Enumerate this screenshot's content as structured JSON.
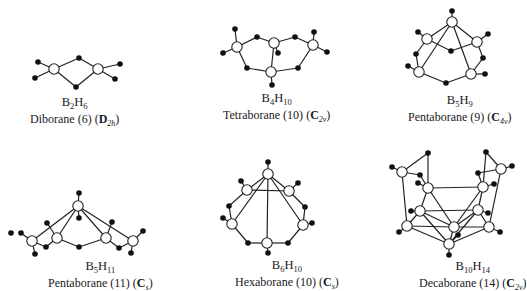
{
  "figure": {
    "structures": [
      {
        "id": "diborane",
        "formula": {
          "el1": "B",
          "n1": "2",
          "el2": "H",
          "n2": "6"
        },
        "name": "Diborane (6)",
        "point_group": {
          "letter": "D",
          "sub": "2h"
        },
        "borons": [
          [
            54,
            69
          ],
          [
            98,
            69
          ]
        ],
        "hydrogens": [
          [
            79,
            58
          ],
          [
            76,
            87
          ],
          [
            38,
            62
          ],
          [
            35,
            78
          ],
          [
            120,
            64
          ],
          [
            115,
            79
          ]
        ],
        "bonds": [
          [
            54,
            69,
            79,
            58
          ],
          [
            79,
            58,
            98,
            69
          ],
          [
            54,
            69,
            76,
            87
          ],
          [
            76,
            87,
            98,
            69
          ],
          [
            54,
            69,
            38,
            62
          ],
          [
            54,
            69,
            35,
            78
          ],
          [
            98,
            69,
            120,
            64
          ],
          [
            98,
            69,
            115,
            79
          ]
        ],
        "label_pos": [
          30,
          96
        ]
      },
      {
        "id": "tetraborane",
        "formula": {
          "el1": "B",
          "n1": "4",
          "el2": "H",
          "n2": "10"
        },
        "name": "Tetraborane (10)",
        "point_group": {
          "letter": "C",
          "sub": "2v"
        },
        "borons": [
          [
            237,
            47
          ],
          [
            274,
            43
          ],
          [
            313,
            45
          ],
          [
            271,
            72
          ]
        ],
        "hydrogens": [
          [
            235,
            29
          ],
          [
            223,
            53
          ],
          [
            257,
            37
          ],
          [
            295,
            37
          ],
          [
            278,
            53
          ],
          [
            314,
            32
          ],
          [
            327,
            52
          ],
          [
            247,
            68
          ],
          [
            298,
            68
          ],
          [
            272,
            85
          ]
        ],
        "bonds": [
          [
            237,
            47,
            235,
            29
          ],
          [
            237,
            47,
            223,
            53
          ],
          [
            237,
            47,
            257,
            37
          ],
          [
            257,
            37,
            274,
            43
          ],
          [
            274,
            43,
            295,
            37
          ],
          [
            295,
            37,
            313,
            45
          ],
          [
            274,
            43,
            278,
            53
          ],
          [
            313,
            45,
            314,
            32
          ],
          [
            313,
            45,
            327,
            52
          ],
          [
            237,
            47,
            247,
            68
          ],
          [
            247,
            68,
            271,
            72
          ],
          [
            271,
            72,
            298,
            68
          ],
          [
            298,
            68,
            313,
            45
          ],
          [
            274,
            43,
            271,
            72
          ],
          [
            271,
            72,
            272,
            85
          ]
        ],
        "label_pos": [
          223,
          92
        ]
      },
      {
        "id": "pentaborane-9",
        "formula": {
          "el1": "B",
          "n1": "5",
          "el2": "H",
          "n2": "9"
        },
        "name": "Pentaborane (9)",
        "point_group": {
          "letter": "C",
          "sub": "4v"
        },
        "borons": [
          [
            452,
            22
          ],
          [
            427,
            39
          ],
          [
            477,
            42
          ],
          [
            419,
            72
          ],
          [
            471,
            74
          ]
        ],
        "hydrogens": [
          [
            452,
            11
          ],
          [
            418,
            32
          ],
          [
            488,
            34
          ],
          [
            408,
            66
          ],
          [
            485,
            74
          ],
          [
            451,
            51
          ],
          [
            416,
            54
          ],
          [
            483,
            58
          ],
          [
            446,
            83
          ]
        ],
        "bonds": [
          [
            452,
            22,
            452,
            11
          ],
          [
            452,
            22,
            427,
            39
          ],
          [
            452,
            22,
            477,
            42
          ],
          [
            452,
            22,
            419,
            72
          ],
          [
            452,
            22,
            471,
            74
          ],
          [
            427,
            39,
            418,
            32
          ],
          [
            477,
            42,
            488,
            34
          ],
          [
            419,
            72,
            408,
            66
          ],
          [
            471,
            74,
            485,
            74
          ],
          [
            427,
            39,
            451,
            51
          ],
          [
            451,
            51,
            477,
            42
          ],
          [
            427,
            39,
            416,
            54
          ],
          [
            416,
            54,
            419,
            72
          ],
          [
            477,
            42,
            483,
            58
          ],
          [
            483,
            58,
            471,
            74
          ],
          [
            419,
            72,
            446,
            83
          ],
          [
            446,
            83,
            471,
            74
          ]
        ],
        "label_pos": [
          408,
          94
        ]
      },
      {
        "id": "pentaborane-11",
        "formula": {
          "el1": "B",
          "n1": "5",
          "el2": "H",
          "n2": "11"
        },
        "name": "Pentaborane (11)",
        "point_group": {
          "letter": "C",
          "sub": "s"
        },
        "borons": [
          [
            78,
            206
          ],
          [
            32,
            241
          ],
          [
            57,
            238
          ],
          [
            106,
            238
          ],
          [
            133,
            241
          ]
        ],
        "hydrogens": [
          [
            79,
            193
          ],
          [
            79,
            218
          ],
          [
            47,
            223
          ],
          [
            112,
            222
          ],
          [
            21,
            233
          ],
          [
            11,
            233
          ],
          [
            143,
            231
          ],
          [
            46,
            247
          ],
          [
            119,
            248
          ],
          [
            79,
            247
          ],
          [
            35,
            254
          ],
          [
            131,
            253
          ]
        ],
        "bonds": [
          [
            78,
            206,
            79,
            193
          ],
          [
            78,
            206,
            79,
            218
          ],
          [
            78,
            206,
            32,
            241
          ],
          [
            78,
            206,
            57,
            238
          ],
          [
            78,
            206,
            106,
            238
          ],
          [
            78,
            206,
            133,
            241
          ],
          [
            57,
            238,
            47,
            223
          ],
          [
            106,
            238,
            112,
            222
          ],
          [
            32,
            241,
            21,
            233
          ],
          [
            133,
            241,
            143,
            231
          ],
          [
            32,
            241,
            46,
            247
          ],
          [
            46,
            247,
            57,
            238
          ],
          [
            57,
            238,
            79,
            247
          ],
          [
            79,
            247,
            106,
            238
          ],
          [
            106,
            238,
            119,
            248
          ],
          [
            119,
            248,
            133,
            241
          ],
          [
            32,
            241,
            35,
            254
          ],
          [
            133,
            241,
            131,
            253
          ]
        ],
        "label_pos": [
          48,
          260
        ]
      },
      {
        "id": "hexaborane",
        "formula": {
          "el1": "B",
          "n1": "6",
          "el2": "H",
          "n2": "10"
        },
        "name": "Hexaborane (10)",
        "point_group": {
          "letter": "C",
          "sub": "s"
        },
        "borons": [
          [
            268,
            174
          ],
          [
            247,
            190
          ],
          [
            289,
            191
          ],
          [
            232,
            224
          ],
          [
            303,
            225
          ],
          [
            267,
            243
          ]
        ],
        "hydrogens": [
          [
            268,
            162
          ],
          [
            241,
            181
          ],
          [
            298,
            183
          ],
          [
            229,
            206
          ],
          [
            305,
            207
          ],
          [
            223,
            218
          ],
          [
            312,
            223
          ],
          [
            248,
            243
          ],
          [
            288,
            243
          ],
          [
            268,
            253
          ]
        ],
        "bonds": [
          [
            268,
            174,
            268,
            162
          ],
          [
            268,
            174,
            247,
            190
          ],
          [
            268,
            174,
            289,
            191
          ],
          [
            268,
            174,
            232,
            224
          ],
          [
            268,
            174,
            303,
            225
          ],
          [
            268,
            174,
            267,
            243
          ],
          [
            247,
            190,
            289,
            191
          ],
          [
            247,
            190,
            241,
            181
          ],
          [
            289,
            191,
            298,
            183
          ],
          [
            247,
            190,
            229,
            206
          ],
          [
            229,
            206,
            232,
            224
          ],
          [
            289,
            191,
            305,
            207
          ],
          [
            305,
            207,
            303,
            225
          ],
          [
            232,
            224,
            223,
            218
          ],
          [
            303,
            225,
            312,
            223
          ],
          [
            232,
            224,
            248,
            243
          ],
          [
            248,
            243,
            267,
            243
          ],
          [
            267,
            243,
            288,
            243
          ],
          [
            288,
            243,
            303,
            225
          ],
          [
            267,
            243,
            268,
            253
          ]
        ],
        "label_pos": [
          235,
          259
        ]
      },
      {
        "id": "decaborane",
        "formula": {
          "el1": "B",
          "n1": "10",
          "el2": "H",
          "n2": "14"
        },
        "name": "Decaborane (14)",
        "point_group": {
          "letter": "C",
          "sub": "2v"
        },
        "borons": [
          [
            402,
            172
          ],
          [
            501,
            169
          ],
          [
            428,
            188
          ],
          [
            483,
            187
          ],
          [
            420,
            211
          ],
          [
            478,
            210
          ],
          [
            407,
            226
          ],
          [
            489,
            227
          ],
          [
            454,
            227
          ],
          [
            449,
            244
          ]
        ],
        "hydrogens": [
          [
            428,
            153
          ],
          [
            486,
            152
          ],
          [
            392,
            167
          ],
          [
            512,
            166
          ],
          [
            420,
            175
          ],
          [
            478,
            173
          ],
          [
            418,
            183
          ],
          [
            494,
            184
          ],
          [
            411,
            211
          ],
          [
            488,
            213
          ],
          [
            399,
            232
          ],
          [
            500,
            232
          ],
          [
            458,
            235
          ],
          [
            449,
            255
          ]
        ],
        "bonds": [
          [
            402,
            172,
            428,
            153
          ],
          [
            428,
            153,
            428,
            188
          ],
          [
            501,
            169,
            486,
            152
          ],
          [
            486,
            152,
            483,
            187
          ],
          [
            402,
            172,
            392,
            167
          ],
          [
            501,
            169,
            512,
            166
          ],
          [
            402,
            172,
            420,
            175
          ],
          [
            420,
            175,
            428,
            188
          ],
          [
            501,
            169,
            478,
            173
          ],
          [
            478,
            173,
            483,
            187
          ],
          [
            428,
            188,
            418,
            183
          ],
          [
            483,
            187,
            494,
            184
          ],
          [
            402,
            172,
            407,
            226
          ],
          [
            501,
            169,
            489,
            227
          ],
          [
            428,
            188,
            483,
            187
          ],
          [
            428,
            188,
            420,
            211
          ],
          [
            483,
            187,
            478,
            210
          ],
          [
            428,
            188,
            454,
            227
          ],
          [
            483,
            187,
            454,
            227
          ],
          [
            420,
            211,
            478,
            210
          ],
          [
            420,
            211,
            411,
            211
          ],
          [
            478,
            210,
            488,
            213
          ],
          [
            420,
            211,
            407,
            226
          ],
          [
            478,
            210,
            489,
            227
          ],
          [
            420,
            211,
            454,
            227
          ],
          [
            478,
            210,
            454,
            227
          ],
          [
            407,
            226,
            399,
            232
          ],
          [
            489,
            227,
            500,
            232
          ],
          [
            407,
            226,
            454,
            227
          ],
          [
            454,
            227,
            489,
            227
          ],
          [
            407,
            226,
            449,
            244
          ],
          [
            489,
            227,
            449,
            244
          ],
          [
            454,
            227,
            449,
            244
          ],
          [
            420,
            211,
            449,
            244
          ],
          [
            478,
            210,
            449,
            244
          ],
          [
            449,
            244,
            458,
            235
          ],
          [
            449,
            244,
            449,
            255
          ]
        ],
        "label_pos": [
          419,
          260
        ]
      }
    ]
  }
}
